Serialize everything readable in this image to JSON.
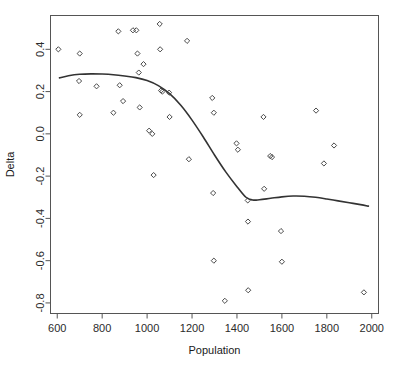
{
  "chart_data": {
    "type": "scatter",
    "title": "",
    "xlabel": "Population",
    "ylabel": "Delta",
    "xlim": [
      570,
      2030
    ],
    "ylim": [
      -0.85,
      0.56
    ],
    "xticks": [
      600,
      800,
      1000,
      1200,
      1400,
      1600,
      1800,
      2000
    ],
    "xtick_labels": [
      "600",
      "800",
      "1000",
      "1200",
      "1400",
      "1600",
      "1800",
      "2000"
    ],
    "yticks": [
      0.4,
      0.2,
      0.0,
      -0.2,
      -0.4,
      -0.6,
      -0.8
    ],
    "ytick_labels": [
      "0.4",
      "0.2",
      "0.0",
      "-0.2",
      "-0.4",
      "-0.6",
      "-0.8"
    ],
    "grid": false,
    "legend": null,
    "point_marker": "open-diamond",
    "point_color": "#4a4a4a",
    "curve_color": "#333333",
    "frame_color": "#555555",
    "points": [
      {
        "x": 605,
        "y": 0.4
      },
      {
        "x": 700,
        "y": 0.38
      },
      {
        "x": 697,
        "y": 0.25
      },
      {
        "x": 700,
        "y": 0.09
      },
      {
        "x": 775,
        "y": 0.225
      },
      {
        "x": 850,
        "y": 0.1
      },
      {
        "x": 872,
        "y": 0.485
      },
      {
        "x": 878,
        "y": 0.23
      },
      {
        "x": 893,
        "y": 0.155
      },
      {
        "x": 937,
        "y": 0.49
      },
      {
        "x": 952,
        "y": 0.49
      },
      {
        "x": 957,
        "y": 0.38
      },
      {
        "x": 963,
        "y": 0.29
      },
      {
        "x": 967,
        "y": 0.125
      },
      {
        "x": 984,
        "y": 0.33
      },
      {
        "x": 1009,
        "y": 0.015
      },
      {
        "x": 1023,
        "y": 0.0
      },
      {
        "x": 1029,
        "y": -0.195
      },
      {
        "x": 1056,
        "y": 0.52
      },
      {
        "x": 1058,
        "y": 0.4
      },
      {
        "x": 1062,
        "y": 0.205
      },
      {
        "x": 1068,
        "y": 0.2
      },
      {
        "x": 1098,
        "y": 0.195
      },
      {
        "x": 1100,
        "y": 0.08
      },
      {
        "x": 1178,
        "y": 0.44
      },
      {
        "x": 1186,
        "y": -0.12
      },
      {
        "x": 1290,
        "y": 0.17
      },
      {
        "x": 1297,
        "y": 0.1
      },
      {
        "x": 1294,
        "y": -0.28
      },
      {
        "x": 1297,
        "y": -0.6
      },
      {
        "x": 1346,
        "y": -0.79
      },
      {
        "x": 1398,
        "y": -0.045
      },
      {
        "x": 1404,
        "y": -0.075
      },
      {
        "x": 1448,
        "y": -0.315
      },
      {
        "x": 1449,
        "y": -0.415
      },
      {
        "x": 1450,
        "y": -0.74
      },
      {
        "x": 1518,
        "y": 0.08
      },
      {
        "x": 1521,
        "y": -0.26
      },
      {
        "x": 1548,
        "y": -0.105
      },
      {
        "x": 1556,
        "y": -0.11
      },
      {
        "x": 1596,
        "y": -0.46
      },
      {
        "x": 1600,
        "y": -0.605
      },
      {
        "x": 1752,
        "y": 0.11
      },
      {
        "x": 1787,
        "y": -0.14
      },
      {
        "x": 1832,
        "y": -0.055
      },
      {
        "x": 1965,
        "y": -0.75
      }
    ],
    "smoothing_curve": {
      "name": "loess-fit",
      "points": [
        {
          "x": 610,
          "y": 0.265
        },
        {
          "x": 650,
          "y": 0.275
        },
        {
          "x": 700,
          "y": 0.282
        },
        {
          "x": 750,
          "y": 0.284
        },
        {
          "x": 800,
          "y": 0.283
        },
        {
          "x": 850,
          "y": 0.28
        },
        {
          "x": 900,
          "y": 0.274
        },
        {
          "x": 950,
          "y": 0.266
        },
        {
          "x": 1000,
          "y": 0.252
        },
        {
          "x": 1050,
          "y": 0.228
        },
        {
          "x": 1100,
          "y": 0.19
        },
        {
          "x": 1150,
          "y": 0.135
        },
        {
          "x": 1200,
          "y": 0.065
        },
        {
          "x": 1250,
          "y": -0.015
        },
        {
          "x": 1300,
          "y": -0.1
        },
        {
          "x": 1350,
          "y": -0.18
        },
        {
          "x": 1400,
          "y": -0.25
        },
        {
          "x": 1440,
          "y": -0.3
        },
        {
          "x": 1470,
          "y": -0.313
        },
        {
          "x": 1500,
          "y": -0.312
        },
        {
          "x": 1550,
          "y": -0.305
        },
        {
          "x": 1600,
          "y": -0.298
        },
        {
          "x": 1650,
          "y": -0.294
        },
        {
          "x": 1700,
          "y": -0.295
        },
        {
          "x": 1750,
          "y": -0.3
        },
        {
          "x": 1800,
          "y": -0.308
        },
        {
          "x": 1850,
          "y": -0.317
        },
        {
          "x": 1900,
          "y": -0.326
        },
        {
          "x": 1950,
          "y": -0.335
        },
        {
          "x": 1985,
          "y": -0.342
        }
      ]
    }
  }
}
